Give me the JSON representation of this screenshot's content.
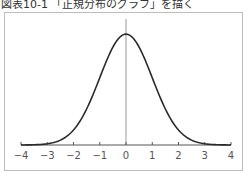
{
  "title": "図表10-1 「正規分布のグラフ」を描く",
  "chart_data": {
    "type": "line",
    "title": "図表10-1 「正規分布のグラフ」を描く",
    "xlabel": "",
    "ylabel": "",
    "xlim": [
      -4,
      4
    ],
    "ylim": [
      0,
      0.45
    ],
    "grid": false,
    "legend": null,
    "x_ticks": [
      "-4",
      "-3",
      "-2",
      "-1",
      "0",
      "1",
      "2",
      "3",
      "4"
    ],
    "series": [
      {
        "name": "standard normal density",
        "x": [
          -4,
          -3.5,
          -3,
          -2.5,
          -2,
          -1.5,
          -1,
          -0.5,
          0,
          0.5,
          1,
          1.5,
          2,
          2.5,
          3,
          3.5,
          4
        ],
        "y": [
          0.0001,
          0.0009,
          0.0044,
          0.0175,
          0.054,
          0.1295,
          0.242,
          0.3521,
          0.3989,
          0.3521,
          0.242,
          0.1295,
          0.054,
          0.0175,
          0.0044,
          0.0009,
          0.0001
        ]
      }
    ]
  }
}
